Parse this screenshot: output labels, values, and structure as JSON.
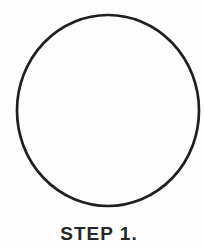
{
  "page": {
    "background_color": "#fdfdfd"
  },
  "figure": {
    "shape": "circle-outline",
    "stroke_color": "#1f1f1f",
    "caption": "STEP 1.",
    "caption_color": "#272727"
  }
}
